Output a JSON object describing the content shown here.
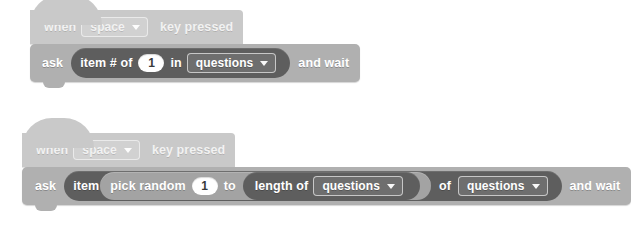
{
  "editor": {
    "name": "scratch-block-editor",
    "background": "#ffffff"
  },
  "palette": {
    "hat_block_color": "#c9c9c9",
    "command_block_color": "#b0b0b0",
    "reporter_dark_color": "#5e5e5e",
    "reporter_mid_color": "#a3a3a3",
    "input_field_color": "#ffffff",
    "text_color": "#ffffff"
  },
  "scripts": [
    {
      "id": "script-1",
      "hat": {
        "word_when": "when",
        "key_dropdown": "space",
        "words_key_pressed": "key pressed"
      },
      "command": {
        "word_ask": "ask",
        "reporter": {
          "word_item_num_of": "item # of",
          "number_value": "1",
          "word_in": "in",
          "list_dropdown": "questions"
        },
        "words_and_wait": "and wait"
      }
    },
    {
      "id": "script-2",
      "hat": {
        "word_when": "when",
        "key_dropdown": "space",
        "words_key_pressed": "key pressed"
      },
      "command": {
        "word_ask": "ask",
        "reporter": {
          "word_item": "item",
          "pick_random": {
            "words_pick_random": "pick random",
            "number_value": "1",
            "word_to": "to",
            "length_of": {
              "words_length_of": "length of",
              "list_dropdown": "questions"
            }
          },
          "word_of": "of",
          "list_dropdown": "questions"
        },
        "words_and_wait": "and wait"
      }
    }
  ]
}
